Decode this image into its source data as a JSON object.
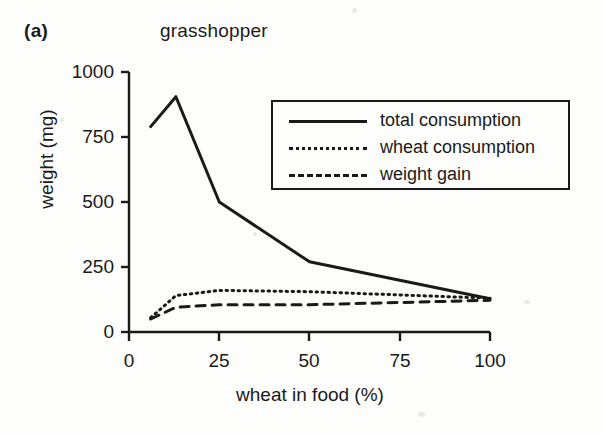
{
  "figure": {
    "panel_label": "(a)",
    "title": "grasshopper"
  },
  "axes": {
    "xlabel": "wheat in food (%)",
    "ylabel": "weight (mg)",
    "xticks": [
      "0",
      "25",
      "50",
      "75",
      "100"
    ],
    "yticks": [
      "0",
      "250",
      "500",
      "750",
      "1000"
    ]
  },
  "legend": {
    "items": [
      {
        "label": "total consumption",
        "style": "solid"
      },
      {
        "label": "wheat consumption",
        "style": "dotted"
      },
      {
        "label": "weight gain",
        "style": "dashed"
      }
    ]
  },
  "colors": {
    "ink": "#1a1a1a",
    "background": "#fdfdfb"
  },
  "chart_data": {
    "type": "line",
    "title": "grasshopper",
    "xlabel": "wheat in food (%)",
    "ylabel": "weight (mg)",
    "xlim": [
      0,
      100
    ],
    "ylim": [
      0,
      1000
    ],
    "xticks": [
      0,
      25,
      50,
      75,
      100
    ],
    "yticks": [
      0,
      250,
      500,
      750,
      1000
    ],
    "grid": false,
    "legend_position": "upper-right-inset",
    "x": [
      6,
      13,
      25,
      50,
      100
    ],
    "series": [
      {
        "name": "total consumption",
        "style": "solid",
        "values": [
          790,
          905,
          500,
          270,
          128
        ]
      },
      {
        "name": "wheat consumption",
        "style": "dotted",
        "values": [
          55,
          140,
          160,
          155,
          130
        ]
      },
      {
        "name": "weight gain",
        "style": "dashed",
        "values": [
          50,
          95,
          105,
          105,
          122
        ]
      }
    ]
  }
}
